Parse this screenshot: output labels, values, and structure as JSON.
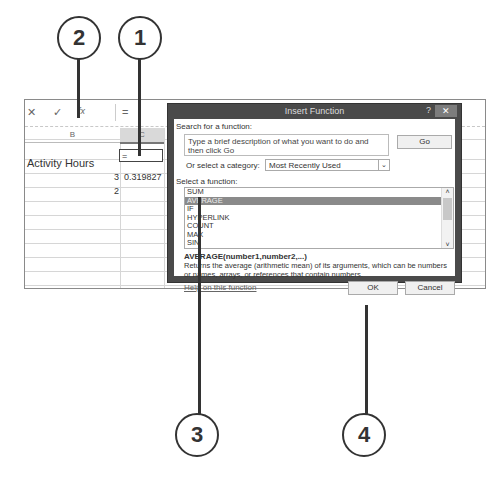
{
  "formula_bar": {
    "cancel_icon": "✕",
    "enter_icon": "✓",
    "fx_icon": "fx",
    "formula": "="
  },
  "sheet": {
    "columns": [
      "B",
      "C"
    ],
    "selected_column": "C",
    "header_cell": "Activity Hours",
    "rows": [
      {
        "b": "3",
        "c": "0.319827"
      },
      {
        "b": "2",
        "c": "="
      }
    ]
  },
  "dialog": {
    "title": "Insert Function",
    "help_icon": "?",
    "close_icon": "✕",
    "search_label": "Search for a function:",
    "search_placeholder": "Type a brief description of what you want to do and then click Go",
    "go_button": "Go",
    "category_label": "Or select a category:",
    "category_value": "Most Recently Used",
    "select_label": "Select a function:",
    "functions": [
      "SUM",
      "AVERAGE",
      "IF",
      "HYPERLINK",
      "COUNT",
      "MAX",
      "SIN"
    ],
    "selected_function": "AVERAGE",
    "signature": "AVERAGE(number1,number2,...)",
    "description": "Returns the average (arithmetic mean) of its arguments, which can be numbers or names, arrays, or references that contain numbers.",
    "help_link": "Help on this function",
    "ok_button": "OK",
    "cancel_button": "Cancel"
  },
  "callouts": [
    "1",
    "2",
    "3",
    "4"
  ]
}
